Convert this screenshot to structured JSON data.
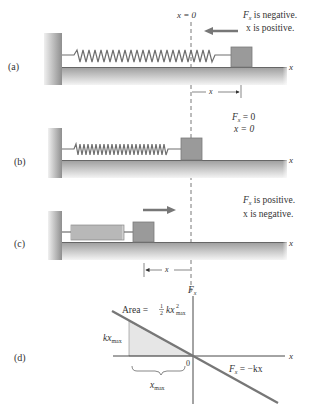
{
  "panels": [
    {
      "id": "a",
      "label": "(a)",
      "origin_label": "x = 0",
      "force_text": "is negative.",
      "force_symbol": "F",
      "force_sub": "x",
      "x_text": "x is positive.",
      "axis_label": "x",
      "dimension_label": "x"
    },
    {
      "id": "b",
      "label": "(b)",
      "force_line": "= 0",
      "force_symbol": "F",
      "force_sub": "x",
      "x_text": "x = 0",
      "axis_label": "x"
    },
    {
      "id": "c",
      "label": "(c)",
      "force_text": "is positive.",
      "force_symbol": "F",
      "force_sub": "x",
      "x_text": "x is negative.",
      "axis_label": "x",
      "dimension_label": "x"
    },
    {
      "id": "d",
      "label": "(d)",
      "y_axis_symbol": "F",
      "y_axis_sub": "x",
      "x_axis_label": "x",
      "area_prefix": "Area = ",
      "area_frac_num": "1",
      "area_frac_den": "2",
      "area_var": "kx",
      "area_sup": "2",
      "area_sub": "max",
      "kx_label": "kx",
      "kx_sub": "max",
      "origin_label": "0",
      "xmax_label": "x",
      "xmax_sub": "max",
      "line_symbol": "F",
      "line_sub": "x",
      "line_eq": " = −kx"
    }
  ],
  "colors": {
    "block": "#9a9a9a",
    "ground": "#a8a8a8",
    "spring": "#6f6f6f",
    "arrow": "#777777",
    "line": "#777777",
    "shade": "#e6e6e6",
    "text": "#333333"
  }
}
